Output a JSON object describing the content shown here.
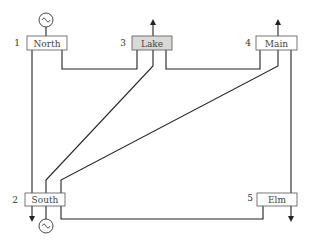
{
  "diagram": {
    "type": "power-system-one-line",
    "buses": [
      {
        "id": 1,
        "number": "1",
        "name": "North",
        "highlighted": false
      },
      {
        "id": 2,
        "number": "2",
        "name": "South",
        "highlighted": false
      },
      {
        "id": 3,
        "number": "3",
        "name": "Lake",
        "highlighted": true
      },
      {
        "id": 4,
        "number": "4",
        "name": "Main",
        "highlighted": false
      },
      {
        "id": 5,
        "number": "5",
        "name": "Elm",
        "highlighted": false
      }
    ],
    "lines": [
      {
        "from": "North",
        "to": "South"
      },
      {
        "from": "North",
        "to": "Lake"
      },
      {
        "from": "South",
        "to": "Lake"
      },
      {
        "from": "South",
        "to": "Main"
      },
      {
        "from": "South",
        "to": "Elm"
      },
      {
        "from": "Lake",
        "to": "Main"
      },
      {
        "from": "Main",
        "to": "Elm"
      }
    ],
    "generators": [
      "North",
      "South"
    ],
    "loads": [
      "South",
      "Lake",
      "Main",
      "Elm"
    ],
    "colors": {
      "bus_fill": "#ffffff",
      "bus_highlight_fill": "#d9d9d9",
      "line": "#222222"
    }
  }
}
